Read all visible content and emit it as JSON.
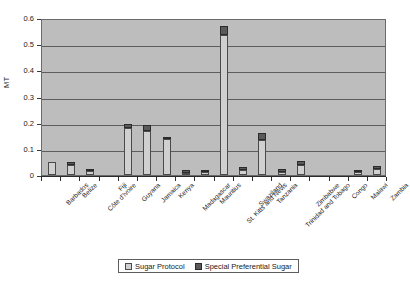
{
  "chart_data": {
    "type": "bar",
    "stacked": true,
    "title": "",
    "xlabel": "",
    "ylabel": "MT",
    "ylim": [
      0,
      0.6
    ],
    "ytick_labels": [
      "0",
      "0.1",
      "0.2",
      "0.3",
      "0.4",
      "0.5",
      "0.6"
    ],
    "ytick_values": [
      0,
      0.1,
      0.2,
      0.3,
      0.4,
      0.5,
      0.6
    ],
    "grid": true,
    "legend_position": "bottom",
    "categories": [
      "Barbados",
      "Belize",
      "Côte d'Ivoire",
      "Fiji",
      "Guyana",
      "Jamaica",
      "Kenya",
      "Madagascar",
      "Mauritius",
      "St. Kitts and Nevis",
      "Swaziland",
      "Tanzania",
      "Trinidad and Tobago",
      "Zimbabwe",
      "",
      "Congo",
      "Malawi",
      "Zambia"
    ],
    "series": [
      {
        "name": "Sugar Protocol",
        "color": "#d0d0d0",
        "values": [
          0.05,
          0.04,
          0.015,
          0.0,
          0.178,
          0.17,
          0.136,
          0.008,
          0.01,
          0.535,
          0.02,
          0.135,
          0.012,
          0.038,
          0.0,
          0.0,
          0.01,
          0.024
        ]
      },
      {
        "name": "Special Preferential Sugar",
        "color": "#5a5a5a",
        "values": [
          0.0,
          0.002,
          0.002,
          0.0,
          0.018,
          0.02,
          0.01,
          0.002,
          0.002,
          0.035,
          0.003,
          0.025,
          0.002,
          0.016,
          0.0,
          0.0,
          0.002,
          0.007
        ]
      }
    ],
    "totals": [
      0.05,
      0.042,
      0.017,
      0.0,
      0.196,
      0.19,
      0.146,
      0.01,
      0.012,
      0.57,
      0.023,
      0.16,
      0.014,
      0.054,
      0.0,
      0.0,
      0.012,
      0.031
    ]
  },
  "legend": {
    "items": [
      {
        "label": "Sugar Protocol"
      },
      {
        "label": "Special Preferential Sugar"
      }
    ]
  },
  "colors": {
    "plot_background": "#bdbdbd",
    "gridline": "#5d5d5d",
    "series_1": "#d0d0d0",
    "series_2": "#5a5a5a",
    "axis": "#2b2b2b"
  }
}
